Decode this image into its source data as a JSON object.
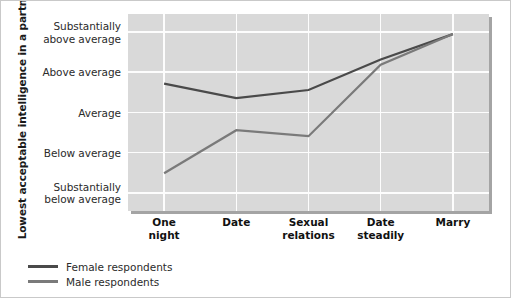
{
  "chart_data": {
    "type": "line",
    "title": "",
    "xlabel": "",
    "ylabel": "Lowest acceptable intelligence\nin a partner",
    "categories": [
      "One\nnight",
      "Date",
      "Sexual\nrelations",
      "Date\nsteadily",
      "Marry"
    ],
    "ytick_labels": [
      "Substantially\nbelow average",
      "Below average",
      "Average",
      "Above average",
      "Substantially\nabove average"
    ],
    "ytick_values": [
      1,
      2,
      3,
      4,
      5
    ],
    "ylim": [
      0.55,
      5.45
    ],
    "grid": true,
    "legend_position": "bottom-left",
    "series": [
      {
        "name": "Female respondents",
        "color": "#4a4a4a",
        "values": [
          3.72,
          3.36,
          3.56,
          4.32,
          4.95
        ]
      },
      {
        "name": "Male respondents",
        "color": "#7a7a7a",
        "values": [
          1.49,
          2.56,
          2.41,
          4.19,
          4.95
        ]
      }
    ]
  },
  "axis": {
    "y_title": "Lowest acceptable intelligence\nin a partner"
  },
  "legend": {
    "items": [
      {
        "label": "Female respondents",
        "color": "#4a4a4a"
      },
      {
        "label": "Male respondents",
        "color": "#7a7a7a"
      }
    ]
  },
  "colors": {
    "plot_background": "#d9d9d9",
    "gridline": "#fdfdfd",
    "page_background": "#ffffff",
    "female_line": "#4a4a4a",
    "male_line": "#7a7a7a"
  }
}
